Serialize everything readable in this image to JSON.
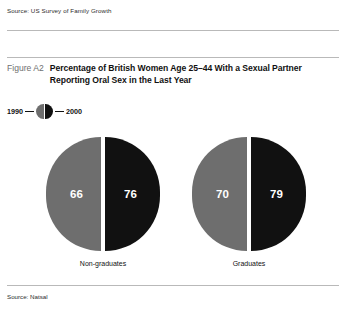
{
  "top_source": "Source:  US Survey of Family Growth",
  "figure": {
    "number": "Figure A2",
    "title_line1": "Percentage of British Women Age 25–44 With a Sexual Partner",
    "title_line2": "Reporting Oral Sex in the Last Year"
  },
  "legend": {
    "left_label": "1990",
    "right_label": "2000",
    "left_color": "#6e6e6e",
    "right_color": "#111111"
  },
  "bottom_source": "Source: Natsal",
  "chart_data": {
    "type": "pie",
    "title": "Percentage of British Women Age 25–44 With a Sexual Partner Reporting Oral Sex in the Last Year",
    "subtitle": "",
    "xlabel": "",
    "ylabel": "",
    "categories": [
      "Non-graduates",
      "Graduates"
    ],
    "series": [
      {
        "name": "1990",
        "color": "#6e6e6e",
        "values": [
          66,
          70
        ]
      },
      {
        "name": "2000",
        "color": "#111111",
        "values": [
          76,
          79
        ]
      }
    ],
    "legend_position": "top-left",
    "grid": false,
    "annotations": [
      "Values shown as percentages inside each half-circle"
    ],
    "groups": [
      {
        "category": "Non-graduates",
        "left_value": "66",
        "right_value": "76"
      },
      {
        "category": "Graduates",
        "left_value": "70",
        "right_value": "79"
      }
    ]
  }
}
